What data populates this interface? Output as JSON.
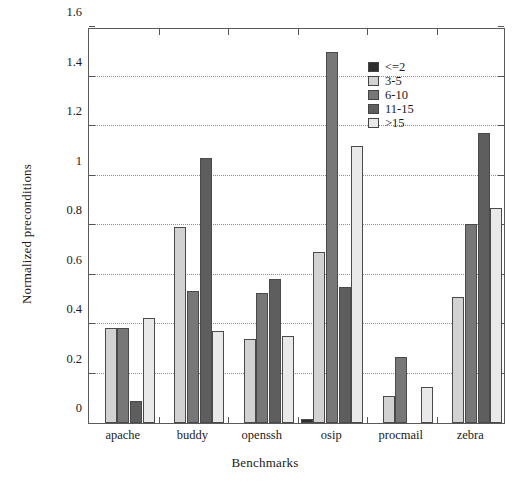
{
  "chart_data": {
    "type": "bar",
    "title": "",
    "xlabel": "Benchmarks",
    "ylabel": "Normalized preconditions",
    "categories": [
      "apache",
      "buddy",
      "openssh",
      "osip",
      "procmail",
      "zebra"
    ],
    "ylim": [
      0,
      1.6
    ],
    "ytick_labels": [
      "0",
      "0.2",
      "0.4",
      "0.6",
      "0.8",
      "1",
      "1.2",
      "1.4",
      "1.6"
    ],
    "ytick_values": [
      0,
      0.2,
      0.4,
      0.6,
      0.8,
      1.0,
      1.2,
      1.4,
      1.6
    ],
    "grid": "horizontal-dotted",
    "legend_position": "top-right-inside",
    "series": [
      {
        "name": "<=2",
        "color": "#2e2e2e",
        "values": [
          0,
          0,
          0,
          0.015,
          0,
          0
        ]
      },
      {
        "name": "3-5",
        "color": "#d2d2d2",
        "values": [
          0.385,
          0.79,
          0.34,
          0.69,
          0.11,
          0.51
        ]
      },
      {
        "name": "6-10",
        "color": "#777777",
        "values": [
          0.385,
          0.535,
          0.525,
          1.5,
          0.265,
          0.805
        ]
      },
      {
        "name": "11-15",
        "color": "#5e5e5e",
        "values": [
          0.09,
          1.07,
          0.58,
          0.55,
          0,
          1.17
        ]
      },
      {
        "name": ">15",
        "color": "#e9e9e9",
        "values": [
          0.425,
          0.37,
          0.35,
          1.12,
          0.145,
          0.87
        ]
      }
    ]
  },
  "legend": {
    "items": [
      {
        "label": "<=2"
      },
      {
        "label": "3-5"
      },
      {
        "label": "6-10"
      },
      {
        "label": "11-15"
      },
      {
        "label": ">15"
      }
    ]
  }
}
